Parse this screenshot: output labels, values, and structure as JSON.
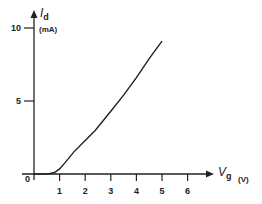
{
  "chart_data": {
    "type": "line",
    "title": "",
    "xlabel": "V",
    "xlabel_sub": "g",
    "xunit": "(V)",
    "ylabel": "I",
    "ylabel_sub": "d",
    "yunit": "(mA)",
    "origin_label": "0",
    "x_ticks": [
      1,
      2,
      3,
      4,
      5,
      6
    ],
    "x_tick_labels": [
      "1",
      "2",
      "3",
      "4",
      "5",
      "6"
    ],
    "y_ticks": [
      5,
      10
    ],
    "y_tick_labels": [
      "5",
      "10"
    ],
    "xlim": [
      0,
      6.5
    ],
    "ylim": [
      0,
      11
    ],
    "grid": false,
    "legend": null,
    "series": [
      {
        "name": "I_d vs V_g",
        "x": [
          0,
          0.55,
          0.8,
          1.0,
          1.2,
          1.55,
          2.0,
          2.4,
          3.0,
          3.5,
          4.0,
          4.5,
          5.0
        ],
        "y": [
          0,
          0,
          0.1,
          0.35,
          0.75,
          1.5,
          2.3,
          3.0,
          4.3,
          5.4,
          6.6,
          7.9,
          9.1
        ]
      }
    ]
  }
}
